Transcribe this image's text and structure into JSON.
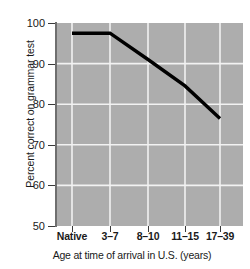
{
  "chart_data": {
    "type": "line",
    "title": "",
    "xlabel": "Age at time of arrival in U.S. (years)",
    "ylabel": "Percent correct on grammar test",
    "categories": [
      "Native",
      "3–7",
      "8–10",
      "11–15",
      "17–39"
    ],
    "values": [
      97.5,
      97.5,
      91,
      84.5,
      76.5
    ],
    "ylim": [
      50,
      100
    ],
    "yticks": [
      100,
      90,
      80,
      70,
      60,
      50
    ],
    "ytick_labels": [
      "100",
      "90",
      "80",
      "70",
      "60",
      "50"
    ],
    "grid": true,
    "grid_color": "#f2f2f2",
    "legend": null,
    "plot_background": "#adadad",
    "line_color": "#000000",
    "line_width": 3
  }
}
